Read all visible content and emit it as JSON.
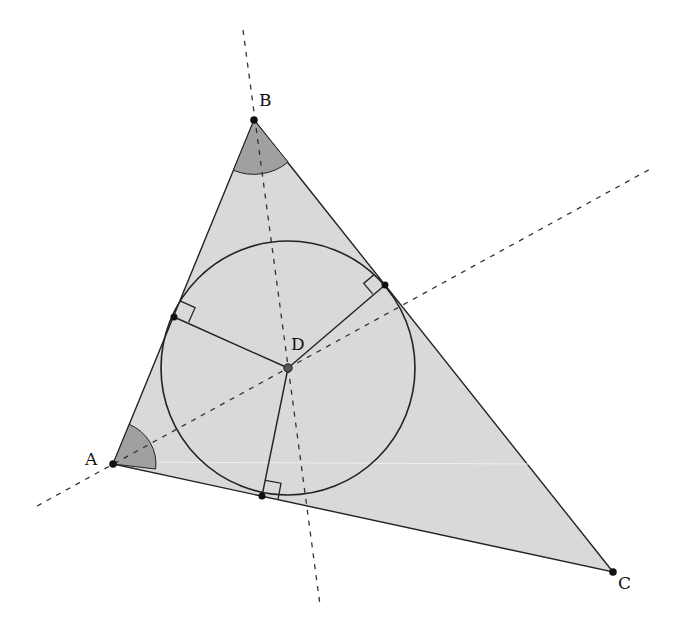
{
  "diagram": {
    "colors": {
      "triangle_fill": "#d9d9d9",
      "angle_fill": "#a0a0a0",
      "stroke": "#222222",
      "dashed": "#333333",
      "background": "#ffffff"
    },
    "points": {
      "A": {
        "label": "A",
        "x": 113,
        "y": 464
      },
      "B": {
        "label": "B",
        "x": 254,
        "y": 120
      },
      "C": {
        "label": "C",
        "x": 613,
        "y": 572
      },
      "D": {
        "label": "D",
        "x": 288,
        "y": 368
      }
    },
    "tangent_points": [
      {
        "name": "on-AB",
        "x": 174,
        "y": 317
      },
      {
        "name": "on-BC",
        "x": 385,
        "y": 285
      },
      {
        "name": "on-AC",
        "x": 262,
        "y": 496
      }
    ],
    "incircle": {
      "cx": 288,
      "cy": 368,
      "r": 127
    },
    "bisectors": [
      {
        "name": "bisector-B",
        "x1": 243,
        "y1": 30,
        "x2": 320,
        "y2": 605
      },
      {
        "name": "bisector-A",
        "x1": 37,
        "y1": 506,
        "x2": 652,
        "y2": 168
      }
    ],
    "marked_angles": [
      "A",
      "B"
    ],
    "right_angle_marks": 3
  }
}
